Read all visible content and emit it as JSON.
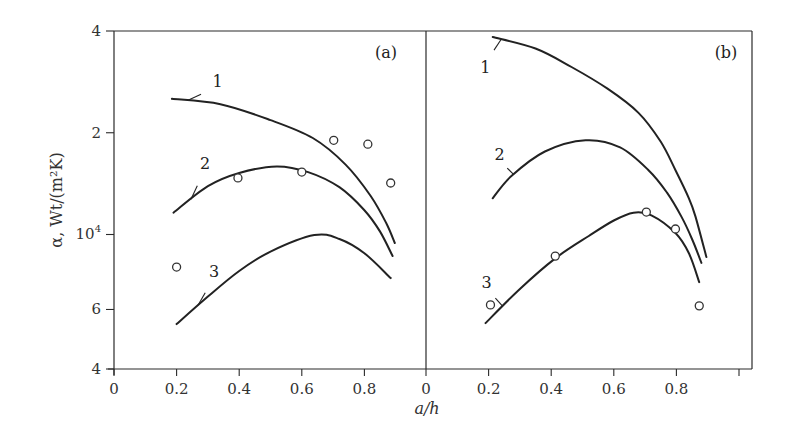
{
  "chart_data": {
    "type": "line",
    "title": "",
    "xlabel": "a/h",
    "ylabel": "α, Wt/(m²K)",
    "yscale": "log",
    "ylim": [
      4000,
      40000
    ],
    "yticks": [
      {
        "value": 4000,
        "label": "4"
      },
      {
        "value": 6000,
        "label": "6"
      },
      {
        "value": 10000,
        "label": "10",
        "sup": "4"
      },
      {
        "value": 20000,
        "label": "2"
      },
      {
        "value": 40000,
        "label": "4"
      }
    ],
    "xticks": [
      {
        "value": 0,
        "label": "0"
      },
      {
        "value": 0.2,
        "label": "0.2"
      },
      {
        "value": 0.4,
        "label": "0.4"
      },
      {
        "value": 0.6,
        "label": "0.6"
      },
      {
        "value": 0.8,
        "label": "0.8"
      },
      {
        "value": 1.0,
        "label": ""
      }
    ],
    "xlim": [
      0,
      1.0
    ],
    "grid": false,
    "panels": [
      {
        "label": "(a)",
        "series": [
          {
            "name": "1",
            "x": [
              0.185,
              0.34,
              0.5,
              0.635,
              0.74,
              0.82,
              0.87,
              0.897
            ],
            "y": [
              25200,
              24300,
              21800,
              19300,
              16100,
              13000,
              10800,
              9440
            ]
          },
          {
            "name": "2",
            "x": [
              0.19,
              0.3,
              0.4,
              0.52,
              0.62,
              0.72,
              0.8,
              0.85,
              0.89
            ],
            "y": [
              11600,
              13900,
              15200,
              15900,
              15300,
              13800,
              11800,
              10200,
              8640
            ]
          },
          {
            "name": "3",
            "x": [
              0.2,
              0.3,
              0.4,
              0.5,
              0.64,
              0.72,
              0.8,
              0.884
            ],
            "y": [
              5430,
              6550,
              7800,
              8900,
              9960,
              9700,
              8800,
              7430
            ]
          }
        ],
        "points": [
          {
            "x": 0.2,
            "y": 8010
          },
          {
            "x": 0.396,
            "y": 14700
          },
          {
            "x": 0.6,
            "y": 15300
          },
          {
            "x": 0.702,
            "y": 19000
          },
          {
            "x": 0.811,
            "y": 18500
          },
          {
            "x": 0.884,
            "y": 14200
          }
        ],
        "curve_labels": [
          {
            "text": "1",
            "series": "1"
          },
          {
            "text": "2",
            "series": "2"
          },
          {
            "text": "3",
            "series": "3"
          }
        ]
      },
      {
        "label": "(b)",
        "series": [
          {
            "name": "1",
            "x": [
              0.213,
              0.35,
              0.465,
              0.58,
              0.679,
              0.75,
              0.797,
              0.84,
              0.861,
              0.896
            ],
            "y": [
              38400,
              35500,
              31300,
              27000,
              22900,
              18800,
              15500,
              12800,
              11300,
              8570
            ]
          },
          {
            "name": "2",
            "x": [
              0.213,
              0.273,
              0.38,
              0.51,
              0.62,
              0.711,
              0.77,
              0.816,
              0.85,
              0.88
            ],
            "y": [
              12800,
              14900,
              17600,
              19000,
              18100,
              15500,
              13300,
              11300,
              9700,
              8240
            ]
          },
          {
            "name": "3",
            "x": [
              0.19,
              0.3,
              0.413,
              0.52,
              0.6,
              0.663,
              0.72,
              0.797,
              0.84,
              0.873
            ],
            "y": [
              5470,
              6900,
              8500,
              9900,
              11000,
              11600,
              11400,
              10100,
              8800,
              7230
            ]
          }
        ],
        "points": [
          {
            "x": 0.206,
            "y": 6190
          },
          {
            "x": 0.413,
            "y": 8630
          },
          {
            "x": 0.704,
            "y": 11650
          },
          {
            "x": 0.797,
            "y": 10380
          },
          {
            "x": 0.873,
            "y": 6150
          }
        ],
        "curve_labels": [
          {
            "text": "1",
            "series": "1"
          },
          {
            "text": "2",
            "series": "2"
          },
          {
            "text": "3",
            "series": "3"
          }
        ]
      }
    ]
  }
}
